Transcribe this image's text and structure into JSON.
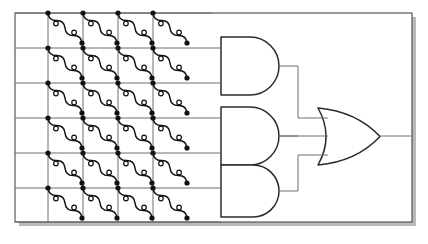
{
  "figure": {
    "name": "crossbar-pla-logic-diagram",
    "type": "circuit-schematic",
    "title": "",
    "background_color": "#ffffff",
    "frame": {
      "name": "outer-frame",
      "x": 15,
      "y": 13,
      "width": 397,
      "height": 209,
      "stroke": "#4a4a4a",
      "stroke_width": 1.1,
      "fill": "#ffffff",
      "shadow": {
        "color": "#b9b9b9",
        "dx": 4,
        "dy": 4
      }
    },
    "crossbar": {
      "name": "crossbar-array",
      "columns": 4,
      "rows": 6,
      "cells": 24,
      "vertical_lines_x": [
        48,
        83,
        118,
        153
      ],
      "horizontal_lines_y": [
        13,
        48,
        83,
        118,
        153,
        188,
        222
      ],
      "vline_top_y": 13,
      "vline_bottom_y": 222,
      "hline_left_x": 15,
      "hline_right_x": 212,
      "line_stroke": "#6e6e6e",
      "line_stroke_width": 1.0
    },
    "cell_element": {
      "name": "memristor-squiggle-element",
      "description": "diagonal wavy two-terminal device",
      "dx": 34,
      "dy": 30,
      "filled_node_radius": 2.6,
      "filled_node_color": "#111111",
      "open_node_radius": 2.3,
      "open_node_fill": "#ffffff",
      "open_node_stroke": "#111111",
      "squiggle_stroke": "#111111",
      "squiggle_stroke_width": 1.5,
      "open_nodes_per_cell": 2
    },
    "and_gates": [
      {
        "name": "and-gate-1",
        "label": "AND",
        "x": 221,
        "y": 37,
        "width": 58,
        "height": 58,
        "input_rows": [
          0,
          1
        ],
        "input_y": [
          48,
          83
        ],
        "output_y": 66,
        "stroke": "#2b2b2b",
        "stroke_width": 1.5
      },
      {
        "name": "and-gate-2",
        "label": "AND",
        "x": 221,
        "y": 107,
        "width": 58,
        "height": 58,
        "input_rows": [
          2,
          3
        ],
        "input_y": [
          118,
          153
        ],
        "output_y": 136,
        "stroke": "#2b2b2b",
        "stroke_width": 1.5
      },
      {
        "name": "and-gate-3",
        "label": "AND",
        "x": 221,
        "y": 165,
        "width": 58,
        "height": 52,
        "input_rows": [
          4,
          5
        ],
        "input_y": [
          188,
          222
        ],
        "output_y": 191,
        "stroke": "#2b2b2b",
        "stroke_width": 1.5
      }
    ],
    "or_gate": {
      "name": "or-gate-1",
      "label": "OR",
      "x": 318,
      "y": 108,
      "width": 62,
      "height": 57,
      "input_y": [
        118,
        136,
        155
      ],
      "output_y": 136,
      "output_end_x": 412,
      "stroke": "#2b2b2b",
      "stroke_width": 1.5
    },
    "wires": {
      "name": "interconnect-wires",
      "stroke": "#6e6e6e",
      "stroke_width": 1.0,
      "bus_x": 298
    }
  },
  "chart_data": {
    "type": "diagram",
    "columns": 4,
    "rows": 6,
    "cell_count": 24,
    "and_gate_count": 3,
    "or_gate_count": 1,
    "legend": []
  }
}
